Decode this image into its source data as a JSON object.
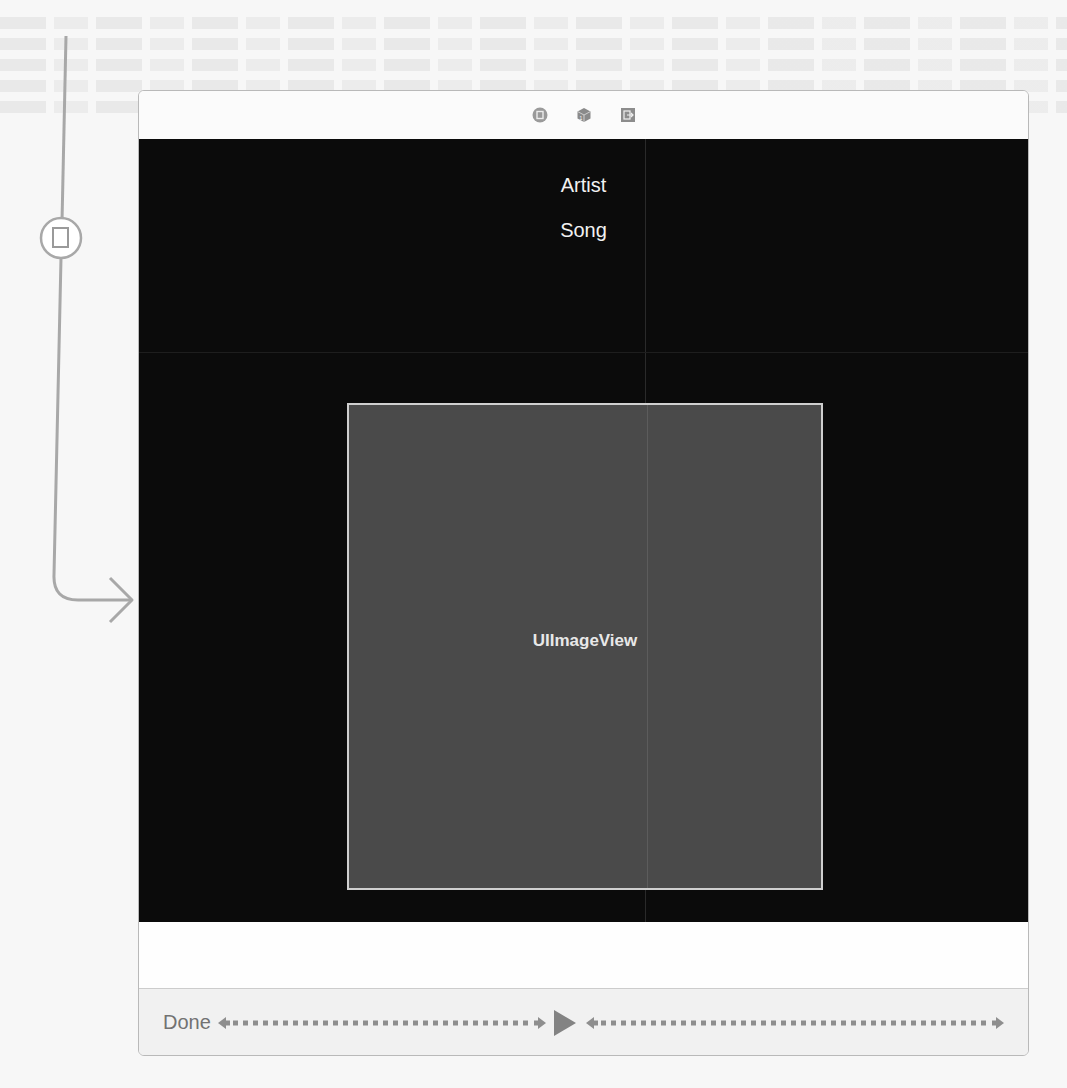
{
  "scene": {
    "dock_icons": [
      {
        "name": "view-controller-icon",
        "color": "#9a9a9a"
      },
      {
        "name": "first-responder-icon",
        "color": "#8a8a8a"
      },
      {
        "name": "exit-icon",
        "color": "#8c8c8c"
      }
    ],
    "view": {
      "background": "#0b0b0b",
      "labels": {
        "artist": "Artist",
        "song": "Song"
      },
      "image_view": {
        "label": "UIImageView",
        "background": "#4a4a4a"
      }
    },
    "toolbar": {
      "done_label": "Done",
      "items": [
        "done-button",
        "flexible-space",
        "play-button",
        "flexible-space"
      ]
    }
  },
  "segue": {
    "icon": "segue-modal-icon",
    "color": "#a8a8a8"
  }
}
